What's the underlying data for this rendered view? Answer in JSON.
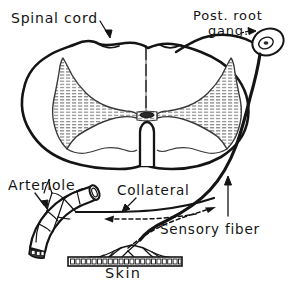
{
  "figure": {
    "ink_color": "#141414",
    "grey_matter_fill": "#9a9a9a",
    "background": "#ffffff",
    "labels": {
      "spinal_cord": "Spinal cord",
      "post_root_gang_line1": "Post. root",
      "post_root_gang_line2": "gang.",
      "arteriole": "Arteriole",
      "collateral": "Collateral",
      "sensory_fiber": "Sensory fiber",
      "skin": "Skin"
    },
    "structures": [
      "spinal-cord-outline",
      "grey-matter-butterfly",
      "central-canal",
      "ventral-median-fissure",
      "posterior-root-ganglion",
      "sensory-fiber",
      "collateral-branch",
      "arteriole",
      "arteriole-nerve-plexus",
      "skin-epithelium",
      "skin-nerve-endings"
    ],
    "leader_arrows": [
      {
        "name": "spinal-cord-arrow",
        "points_to": "top-median-notch"
      },
      {
        "name": "post-root-gang-arrow",
        "points_to": "ganglion-oval"
      },
      {
        "name": "arteriole-arrow",
        "points_to": "arteriole-tube"
      },
      {
        "name": "collateral-arrow",
        "points_to": "collateral-branch"
      },
      {
        "name": "sensory-fiber-arrow",
        "points_to": "sensory-fiber-trunk"
      }
    ],
    "flow_arrowheads": [
      {
        "name": "collateral-flow-arrowhead",
        "direction": "left"
      },
      {
        "name": "sensory-flow-arrowhead",
        "direction": "right"
      }
    ],
    "skin_cell_count": 21
  }
}
